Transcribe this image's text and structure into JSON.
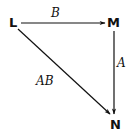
{
  "diagram": {
    "type": "commutative-diagram",
    "nodes": {
      "L": {
        "label": "L"
      },
      "M": {
        "label": "M"
      },
      "N": {
        "label": "N"
      }
    },
    "edges": [
      {
        "from": "L",
        "to": "M",
        "label": "B"
      },
      {
        "from": "M",
        "to": "N",
        "label": "A"
      },
      {
        "from": "L",
        "to": "N",
        "label": "AB"
      }
    ],
    "colors": {
      "ink": "#111111",
      "background": "#ffffff"
    }
  }
}
